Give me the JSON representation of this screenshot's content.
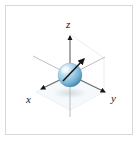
{
  "figure": {
    "name": "3d-coordinate-axes-with-sphere",
    "background_color": "#ffffff",
    "border_color": "#d8d8d8",
    "labels": {
      "z": "z",
      "x": "x",
      "y": "y"
    },
    "colors": {
      "axis_line": "#6e6e6e",
      "axis_line_faint": "#b8b8b8",
      "arrowhead": "#1a1a1a",
      "sphere_light": "#dceaf5",
      "sphere_mid": "#8cc0dd",
      "sphere_dark": "#4a8cb0",
      "sphere_edge": "#3b7a9c",
      "guide_line": "#e2e8ec",
      "ground_plane": "#f2f6f8",
      "label_text": "#1a1a1a"
    },
    "origin": {
      "x": 70,
      "y": 75
    },
    "axes": [
      {
        "id": "z-positive",
        "label": "z",
        "from": [
          70,
          75
        ],
        "to": [
          70,
          34
        ],
        "arrowhead": true,
        "label_position": [
          66,
          19
        ]
      },
      {
        "id": "z-negative",
        "label": "",
        "from": [
          70,
          75
        ],
        "to": [
          70,
          116
        ],
        "arrowhead": false,
        "faint": true
      },
      {
        "id": "y-positive",
        "label": "y",
        "from": [
          70,
          75
        ],
        "to": [
          106,
          93
        ],
        "arrowhead": true,
        "label_position": [
          111,
          93
        ]
      },
      {
        "id": "y-negative",
        "label": "",
        "from": [
          70,
          75
        ],
        "to": [
          34,
          57
        ],
        "arrowhead": false,
        "faint": true
      },
      {
        "id": "x-positive",
        "label": "x",
        "from": [
          70,
          75
        ],
        "to": [
          40,
          90
        ],
        "arrowhead": true,
        "label_position": [
          26,
          94
        ]
      },
      {
        "id": "x-negative",
        "label": "",
        "from": [
          70,
          75
        ],
        "to": [
          104,
          58
        ],
        "arrowhead": false,
        "faint": true
      }
    ],
    "vector_arrow": {
      "id": "sphere-direction-arrow",
      "from": [
        64,
        80
      ],
      "to": [
        85,
        58
      ],
      "arrowhead": true,
      "color": "#1a1a1a"
    },
    "sphere": {
      "center": [
        70,
        75
      ],
      "radius": 12,
      "highlight_offset": [
        -4,
        -5
      ]
    },
    "guides": [
      {
        "id": "ground-plane-parallelogram",
        "points": "70,110 104,92 70,74 36,92"
      },
      {
        "id": "back-vertical-guide",
        "from": [
          104,
          58
        ],
        "to": [
          104,
          92
        ]
      },
      {
        "id": "back-diagonal-guide",
        "from": [
          70,
          34
        ],
        "to": [
          104,
          58
        ]
      }
    ]
  }
}
